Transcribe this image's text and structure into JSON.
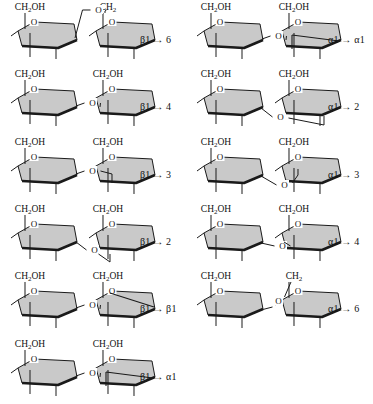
{
  "figure": {
    "ring_style": "Haworth projection",
    "ring_fill": "#c9c9c9",
    "ring_stroke": "#1a1a1a",
    "bond_color": "#1a1a1a",
    "text_color": "#111111",
    "background": "#ffffff",
    "ring_oxygen_label": "O",
    "linking_oxygen_label": "O",
    "hydroxymethyl_label": "CH",
    "hydroxymethyl_sub": "2",
    "hydroxymethyl_tail": "OH",
    "methylene_label": "CH",
    "methylene_sub": "2",
    "arrow": "→",
    "alpha": "α",
    "beta": "β"
  },
  "columns": [
    {
      "name": "beta-linkages",
      "rows": [
        {
          "id": "b1-6",
          "label": "β1 → 6",
          "anomeric": "beta",
          "target": "6",
          "left_top": "CH2OH",
          "right_top": "CH2",
          "link_route": "top-high",
          "right_anomeric": null
        },
        {
          "id": "b1-4",
          "label": "β1 → 4",
          "anomeric": "beta",
          "target": "4",
          "left_top": "CH2OH",
          "right_top": "CH2OH",
          "link_route": "mid",
          "right_anomeric": null
        },
        {
          "id": "b1-3",
          "label": "β1 → 3",
          "anomeric": "beta",
          "target": "3",
          "left_top": "CH2OH",
          "right_top": "CH2OH",
          "link_route": "mid-into-ring",
          "right_anomeric": null
        },
        {
          "id": "b1-2",
          "label": "β1 → 2",
          "anomeric": "beta",
          "target": "2",
          "left_top": "CH2OH",
          "right_top": "CH2OH",
          "link_route": "low",
          "right_anomeric": null
        },
        {
          "id": "b1-b1",
          "label": "β1 → β1",
          "anomeric": "beta",
          "target": "beta1",
          "left_top": "CH2OH",
          "right_top": "CH2OH",
          "link_route": "mid",
          "right_anomeric": "beta"
        },
        {
          "id": "b1-a1",
          "label": "β1 → α1",
          "anomeric": "beta",
          "target": "alpha1",
          "left_top": "CH2OH",
          "right_top": "CH2OH",
          "link_route": "mid",
          "right_anomeric": "alpha"
        }
      ]
    },
    {
      "name": "alpha-linkages",
      "rows": [
        {
          "id": "a1-a1",
          "label": "α1 → α1",
          "anomeric": "alpha",
          "target": "alpha1",
          "left_top": "CH2OH",
          "right_top": "CH2OH",
          "link_route": "mid",
          "right_anomeric": "alpha"
        },
        {
          "id": "a1-2",
          "label": "α1 → 2",
          "anomeric": "alpha",
          "target": "2",
          "left_top": "CH2OH",
          "right_top": "CH2OH",
          "link_route": "low-wide",
          "right_anomeric": null
        },
        {
          "id": "a1-3",
          "label": "α1 → 3",
          "anomeric": "alpha",
          "target": "3",
          "left_top": "CH2OH",
          "right_top": "CH2OH",
          "link_route": "low-into-ring",
          "right_anomeric": null
        },
        {
          "id": "a1-4",
          "label": "α1 → 4",
          "anomeric": "alpha",
          "target": "4",
          "left_top": "CH2OH",
          "right_top": "CH2OH",
          "link_route": "low-mid",
          "right_anomeric": null
        },
        {
          "id": "a1-6",
          "label": "α1 → 6",
          "anomeric": "alpha",
          "target": "6",
          "left_top": "CH2OH",
          "right_top": "CH2",
          "link_route": "up-to-c6",
          "right_anomeric": null
        }
      ]
    }
  ]
}
